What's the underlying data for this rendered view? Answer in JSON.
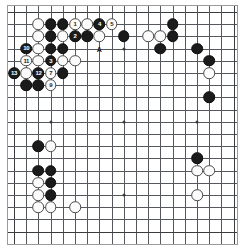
{
  "diagram": {
    "board_size": 19,
    "colors": {
      "black_stone": "#1b1b1b",
      "white_stone": "#fbfbfb",
      "grid_line": "#55585c",
      "board_background": "#ffffff",
      "black_label_text": "#ffffff",
      "white_label_text": "#1b1b1b"
    },
    "geometry": {
      "origin_x": 6,
      "origin_y": 6,
      "spacing": 12.2,
      "stone_diameter": 11.6
    },
    "star_points": [
      {
        "col": 3,
        "row": 3
      },
      {
        "col": 9,
        "row": 3
      },
      {
        "col": 15,
        "row": 3
      },
      {
        "col": 3,
        "row": 9
      },
      {
        "col": 9,
        "row": 9
      },
      {
        "col": 15,
        "row": 9
      },
      {
        "col": 3,
        "row": 15
      },
      {
        "col": 9,
        "row": 15
      },
      {
        "col": 15,
        "row": 15
      }
    ]
  },
  "stones": [
    {
      "col": 2,
      "row": 1,
      "color": "white",
      "label": ""
    },
    {
      "col": 3,
      "row": 1,
      "color": "black",
      "label": ""
    },
    {
      "col": 4,
      "row": 1,
      "color": "black",
      "label": ""
    },
    {
      "col": 5,
      "row": 1,
      "color": "white",
      "label": "1"
    },
    {
      "col": 6,
      "row": 1,
      "color": "white",
      "label": ""
    },
    {
      "col": 7,
      "row": 1,
      "color": "black",
      "label": "4"
    },
    {
      "col": 8,
      "row": 1,
      "color": "white",
      "label": "5"
    },
    {
      "col": 13,
      "row": 1,
      "color": "black",
      "label": ""
    },
    {
      "col": 2,
      "row": 2,
      "color": "white",
      "label": ""
    },
    {
      "col": 3,
      "row": 2,
      "color": "black",
      "label": ""
    },
    {
      "col": 4,
      "row": 2,
      "color": "white",
      "label": ""
    },
    {
      "col": 5,
      "row": 2,
      "color": "black",
      "label": "2"
    },
    {
      "col": 6,
      "row": 2,
      "color": "black",
      "label": ""
    },
    {
      "col": 7,
      "row": 2,
      "color": "white",
      "label": ""
    },
    {
      "col": 9,
      "row": 2,
      "color": "black",
      "label": ""
    },
    {
      "col": 11,
      "row": 2,
      "color": "white",
      "label": ""
    },
    {
      "col": 12,
      "row": 2,
      "color": "white",
      "label": ""
    },
    {
      "col": 13,
      "row": 2,
      "color": "black",
      "label": ""
    },
    {
      "col": 1,
      "row": 3,
      "color": "black",
      "label": "10"
    },
    {
      "col": 2,
      "row": 3,
      "color": "white",
      "label": ""
    },
    {
      "col": 3,
      "row": 3,
      "color": "black",
      "label": ""
    },
    {
      "col": 4,
      "row": 3,
      "color": "black",
      "label": ""
    },
    {
      "col": 12,
      "row": 3,
      "color": "black",
      "label": ""
    },
    {
      "col": 15,
      "row": 3,
      "color": "black",
      "label": ""
    },
    {
      "col": 1,
      "row": 4,
      "color": "white",
      "label": "11"
    },
    {
      "col": 2,
      "row": 4,
      "color": "white",
      "label": ""
    },
    {
      "col": 3,
      "row": 4,
      "color": "black",
      "label": "3"
    },
    {
      "col": 4,
      "row": 4,
      "color": "white",
      "label": ""
    },
    {
      "col": 5,
      "row": 4,
      "color": "white",
      "label": ""
    },
    {
      "col": 16,
      "row": 4,
      "color": "black",
      "label": ""
    },
    {
      "col": 0,
      "row": 5,
      "color": "black",
      "label": "13"
    },
    {
      "col": 1,
      "row": 5,
      "color": "white",
      "label": ""
    },
    {
      "col": 2,
      "row": 5,
      "color": "black",
      "label": "12"
    },
    {
      "col": 3,
      "row": 5,
      "color": "white",
      "label": "7"
    },
    {
      "col": 4,
      "row": 5,
      "color": "black",
      "label": ""
    },
    {
      "col": 16,
      "row": 5,
      "color": "white",
      "label": ""
    },
    {
      "col": 1,
      "row": 6,
      "color": "black",
      "label": ""
    },
    {
      "col": 2,
      "row": 6,
      "color": "black",
      "label": ""
    },
    {
      "col": 3,
      "row": 6,
      "color": "white",
      "label": "9"
    },
    {
      "col": 16,
      "row": 7,
      "color": "black",
      "label": ""
    },
    {
      "col": 2,
      "row": 11,
      "color": "black",
      "label": ""
    },
    {
      "col": 3,
      "row": 11,
      "color": "white",
      "label": ""
    },
    {
      "col": 15,
      "row": 12,
      "color": "black",
      "label": ""
    },
    {
      "col": 15,
      "row": 13,
      "color": "white",
      "label": ""
    },
    {
      "col": 16,
      "row": 13,
      "color": "white",
      "label": ""
    },
    {
      "col": 2,
      "row": 13,
      "color": "black",
      "label": ""
    },
    {
      "col": 3,
      "row": 13,
      "color": "black",
      "label": ""
    },
    {
      "col": 2,
      "row": 14,
      "color": "white",
      "label": ""
    },
    {
      "col": 3,
      "row": 14,
      "color": "black",
      "label": ""
    },
    {
      "col": 15,
      "row": 15,
      "color": "white",
      "label": ""
    },
    {
      "col": 2,
      "row": 15,
      "color": "white",
      "label": ""
    },
    {
      "col": 3,
      "row": 15,
      "color": "black",
      "label": ""
    },
    {
      "col": 2,
      "row": 16,
      "color": "white",
      "label": ""
    },
    {
      "col": 3,
      "row": 16,
      "color": "white",
      "label": ""
    },
    {
      "col": 5,
      "row": 16,
      "color": "white",
      "label": ""
    }
  ],
  "markers": [
    {
      "col": 7,
      "row": 3,
      "text": "A"
    }
  ]
}
